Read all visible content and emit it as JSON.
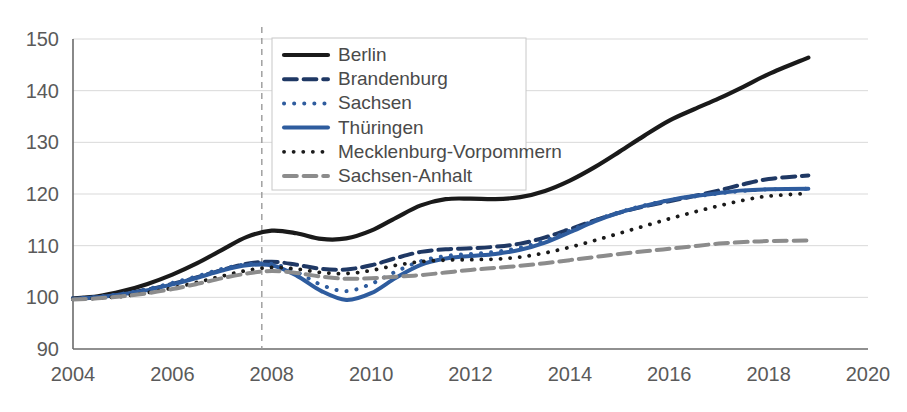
{
  "chart_data": {
    "type": "line",
    "title": "",
    "xlabel": "",
    "ylabel": "",
    "xlim": [
      2004,
      2020
    ],
    "ylim": [
      90,
      150
    ],
    "x_ticks": [
      2004,
      2006,
      2008,
      2010,
      2012,
      2014,
      2016,
      2018,
      2020
    ],
    "y_ticks": [
      90,
      100,
      110,
      120,
      130,
      140,
      150
    ],
    "grid": "horizontal",
    "legend_position": "top-center",
    "annotations": [
      {
        "name": "vertical-reference-line",
        "type": "vline",
        "x": 2007.8,
        "style": "dashed",
        "color": "#9a9a9a"
      }
    ],
    "x": [
      2004,
      2004.5,
      2005,
      2005.5,
      2006,
      2006.5,
      2007,
      2007.5,
      2008,
      2008.5,
      2009,
      2009.5,
      2010,
      2010.5,
      2011,
      2011.5,
      2012,
      2012.5,
      2013,
      2013.5,
      2014,
      2014.5,
      2015,
      2015.5,
      2016,
      2016.5,
      2017,
      2017.5,
      2018,
      2018.8
    ],
    "series": [
      {
        "name": "Berlin",
        "color": "#1a1a1a",
        "style": "solid",
        "width": 4.2,
        "values": [
          99.8,
          100.2,
          101.2,
          102.6,
          104.4,
          106.6,
          109.2,
          111.7,
          112.9,
          112.4,
          111.3,
          111.4,
          112.9,
          115.4,
          117.8,
          119.0,
          119.1,
          119.0,
          119.4,
          120.6,
          122.6,
          125.2,
          128.2,
          131.3,
          134.2,
          136.4,
          138.5,
          140.8,
          143.2,
          146.4
        ]
      },
      {
        "name": "Brandenburg",
        "color": "#1f3864",
        "style": "dashed",
        "width": 4.0,
        "values": [
          99.7,
          100.0,
          100.6,
          101.5,
          102.6,
          103.9,
          105.3,
          106.5,
          106.9,
          106.3,
          105.5,
          105.4,
          106.2,
          107.6,
          108.8,
          109.3,
          109.5,
          109.8,
          110.4,
          111.6,
          113.2,
          114.9,
          116.4,
          117.6,
          118.6,
          119.6,
          120.7,
          121.9,
          122.9,
          123.6
        ]
      },
      {
        "name": "Sachsen",
        "color": "#2e5c9e",
        "style": "dotted",
        "width": 4.0,
        "values": [
          99.8,
          100.1,
          100.7,
          101.6,
          102.8,
          104.1,
          105.5,
          106.4,
          106.5,
          104.9,
          102.4,
          101.2,
          102.6,
          105.0,
          107.0,
          108.0,
          108.4,
          108.8,
          109.6,
          111.0,
          112.9,
          114.9,
          116.5,
          117.8,
          118.8,
          119.5,
          120.1,
          120.6,
          120.9,
          121.0
        ]
      },
      {
        "name": "Thüringen",
        "color": "#2e5c9e",
        "style": "solid",
        "width": 4.0,
        "values": [
          99.7,
          100.0,
          100.6,
          101.4,
          102.5,
          103.8,
          105.2,
          106.2,
          106.2,
          104.2,
          101.2,
          99.5,
          100.8,
          103.8,
          106.3,
          107.5,
          108.0,
          108.4,
          109.2,
          110.6,
          112.6,
          114.7,
          116.4,
          117.7,
          118.8,
          119.6,
          120.2,
          120.7,
          120.9,
          121.0
        ]
      },
      {
        "name": "Mecklenburg-Vorpommern",
        "color": "#1a1a1a",
        "style": "dotted",
        "width": 3.8,
        "values": [
          99.6,
          99.8,
          100.2,
          100.9,
          101.8,
          102.9,
          104.1,
          105.2,
          105.8,
          105.5,
          104.8,
          104.6,
          105.2,
          106.2,
          106.9,
          107.2,
          107.3,
          107.4,
          107.8,
          108.6,
          109.7,
          111.0,
          112.4,
          113.8,
          115.2,
          116.5,
          117.7,
          118.8,
          119.6,
          120.1
        ]
      },
      {
        "name": "Sachsen-Anhalt",
        "color": "#8c8c8c",
        "style": "dashed",
        "width": 4.0,
        "values": [
          99.6,
          99.8,
          100.2,
          100.8,
          101.6,
          102.6,
          103.7,
          104.6,
          105.1,
          104.7,
          104.0,
          103.6,
          103.7,
          104.0,
          104.3,
          104.8,
          105.3,
          105.7,
          106.1,
          106.6,
          107.2,
          107.8,
          108.4,
          108.9,
          109.4,
          109.9,
          110.4,
          110.7,
          110.9,
          111.0
        ]
      }
    ]
  },
  "legend": {
    "items": [
      {
        "label": "Berlin"
      },
      {
        "label": "Brandenburg"
      },
      {
        "label": "Sachsen"
      },
      {
        "label": "Thüringen"
      },
      {
        "label": "Mecklenburg-Vorpommern"
      },
      {
        "label": "Sachsen-Anhalt"
      }
    ]
  }
}
